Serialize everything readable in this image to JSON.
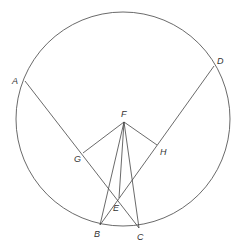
{
  "diagram": {
    "type": "circle-geometry",
    "circle": {
      "cx": 123,
      "cy": 119,
      "r": 107
    },
    "points": {
      "A": {
        "x": 25,
        "y": 81,
        "label": "A",
        "lx": 12,
        "ly": 84
      },
      "D": {
        "x": 214,
        "y": 66,
        "label": "D",
        "lx": 217,
        "ly": 64
      },
      "F": {
        "x": 124,
        "y": 122,
        "label": "F",
        "lx": 121,
        "ly": 117
      },
      "G": {
        "x": 83,
        "y": 153,
        "label": "G",
        "lx": 74,
        "ly": 162
      },
      "H": {
        "x": 157,
        "y": 145,
        "label": "H",
        "lx": 160,
        "ly": 155
      },
      "E": {
        "x": 119,
        "y": 198,
        "label": "E",
        "lx": 113,
        "ly": 211
      },
      "B": {
        "x": 100,
        "y": 225,
        "label": "B",
        "lx": 94,
        "ly": 237
      },
      "C": {
        "x": 139,
        "y": 228,
        "label": "C",
        "lx": 137,
        "ly": 240
      }
    },
    "segments": [
      [
        "A",
        "C"
      ],
      [
        "D",
        "B"
      ],
      [
        "F",
        "G"
      ],
      [
        "F",
        "H"
      ],
      [
        "F",
        "B"
      ],
      [
        "F",
        "C"
      ],
      [
        "F",
        "E"
      ]
    ],
    "labels": [
      "A",
      "B",
      "C",
      "D",
      "E",
      "F",
      "G",
      "H"
    ]
  }
}
